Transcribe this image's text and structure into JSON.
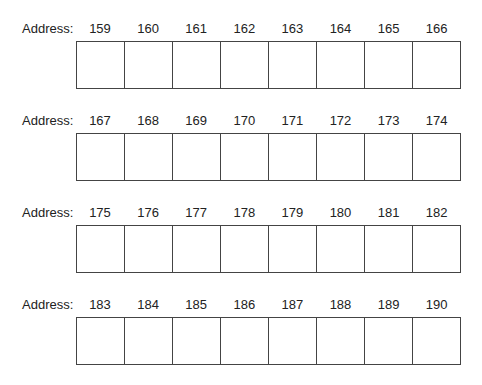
{
  "label": "Address:",
  "rows": [
    {
      "addresses": [
        "159",
        "160",
        "161",
        "162",
        "163",
        "164",
        "165",
        "166"
      ]
    },
    {
      "addresses": [
        "167",
        "168",
        "169",
        "170",
        "171",
        "172",
        "173",
        "174"
      ]
    },
    {
      "addresses": [
        "175",
        "176",
        "177",
        "178",
        "179",
        "180",
        "181",
        "182"
      ]
    },
    {
      "addresses": [
        "183",
        "184",
        "185",
        "186",
        "187",
        "188",
        "189",
        "190"
      ]
    }
  ]
}
